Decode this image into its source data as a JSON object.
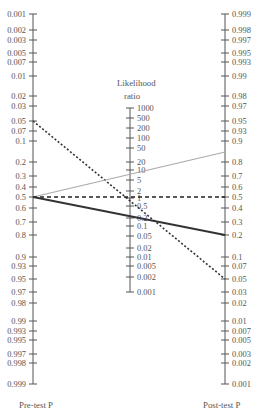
{
  "chart_data": {
    "type": "nomogram",
    "axes": {
      "pre_test": {
        "label": "Pre-test P",
        "ticks": [
          "0.001",
          "0.002",
          "0.003",
          "0.005",
          "0.007",
          "0.01",
          "0.02",
          "0.03",
          "0.05",
          "0.07",
          "0.1",
          "0.2",
          "0.3",
          "0.4",
          "0.5",
          "0.6",
          "0.7",
          "0.8",
          "0.9",
          "0.93",
          "0.95",
          "0.97",
          "0.98",
          "0.99",
          "0.993",
          "0.995",
          "0.997",
          "0.998",
          "0.999"
        ]
      },
      "likelihood_ratio": {
        "label_line1": "Likelihood",
        "label_line2": "ratio",
        "ticks": [
          "1000",
          "500",
          "200",
          "100",
          "50",
          "20",
          "10",
          "5",
          "2",
          "1",
          "0.5",
          "0.2",
          "0.1",
          "0.05",
          "0.02",
          "0.01",
          "0.005",
          "0.002",
          "0.001"
        ]
      },
      "post_test": {
        "label": "Post-test P",
        "ticks": [
          "0.999",
          "0.998",
          "0.997",
          "0.995",
          "0.993",
          "0.99",
          "0.98",
          "0.97",
          "0.95",
          "0.93",
          "0.9",
          "0.8",
          "0.7",
          "0.6",
          "0.5",
          "0.4",
          "0.3",
          "0.2",
          "0.1",
          "0.07",
          "0.05",
          "0.03",
          "0.02",
          "0.01",
          "0.007",
          "0.005",
          "0.003",
          "0.002",
          "0.001"
        ]
      }
    },
    "series": [
      {
        "name": "dotted line",
        "style": "dotted",
        "color": "#333333",
        "pre_test": 0.05,
        "likelihood_ratio": 1,
        "post_test": 0.05
      },
      {
        "name": "gray line",
        "style": "solid",
        "color": "#aaaaaa",
        "pre_test": 0.5,
        "likelihood_ratio": 5,
        "post_test": 0.85
      },
      {
        "name": "dashed line",
        "style": "dashed",
        "color": "#222222",
        "pre_test": 0.5,
        "likelihood_ratio": 1,
        "post_test": 0.5
      },
      {
        "name": "dark line",
        "style": "solid",
        "color": "#333333",
        "pre_test": 0.5,
        "likelihood_ratio": 0.25,
        "post_test": 0.2
      }
    ]
  }
}
